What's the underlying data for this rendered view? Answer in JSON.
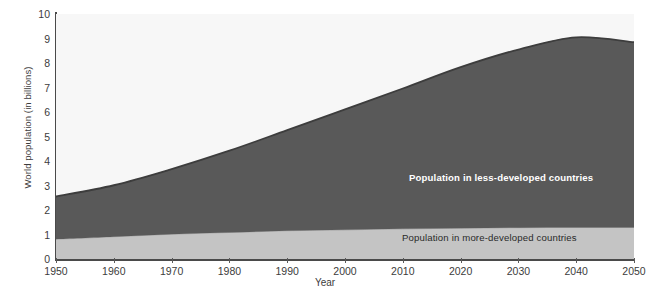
{
  "chart_data": {
    "type": "area",
    "title": "",
    "subtitle": "",
    "xlabel": "Year",
    "ylabel": "World population (in billions)",
    "xlim": [
      1950,
      2050
    ],
    "ylim": [
      0,
      10
    ],
    "grid": false,
    "legend_position": "in-plot annotations",
    "xticks": [
      1950,
      1960,
      1970,
      1980,
      1990,
      2000,
      2010,
      2020,
      2030,
      2040,
      2050
    ],
    "xtick_labels": [
      "1950",
      "1960",
      "1970",
      "1980",
      "1990",
      "2000",
      "2010",
      "2020",
      "2030",
      "2040",
      "2050"
    ],
    "yticks": [
      0,
      1,
      2,
      3,
      4,
      5,
      6,
      7,
      8,
      9,
      10
    ],
    "ytick_labels": [
      "0",
      "1",
      "2",
      "3",
      "4",
      "5",
      "6",
      "7",
      "8",
      "9",
      "10"
    ],
    "stacked": true,
    "x": [
      1950,
      1960,
      1970,
      1980,
      1990,
      2000,
      2010,
      2020,
      2030,
      2040,
      2050
    ],
    "series": [
      {
        "name": "Population in more-developed countries",
        "color": "#c4c4c4",
        "label_color": "#2a2a2a",
        "values": [
          0.81,
          0.91,
          1.01,
          1.08,
          1.15,
          1.19,
          1.23,
          1.26,
          1.28,
          1.29,
          1.29
        ]
      },
      {
        "name": "Population in less-developed countries",
        "color": "#595959",
        "label_color": "#ffffff",
        "values": [
          1.74,
          2.1,
          2.66,
          3.34,
          4.11,
          4.92,
          5.73,
          6.57,
          7.27,
          7.76,
          7.56
        ]
      }
    ],
    "cumulative_totals": [
      2.55,
      3.01,
      3.67,
      4.42,
      5.26,
      6.11,
      6.96,
      7.83,
      8.55,
      9.05,
      8.85
    ],
    "annotations": [
      {
        "text": "Population in less-developed countries",
        "x": 2016,
        "y": 3.6
      },
      {
        "text": "Population in more-developed countries",
        "x": 2015,
        "y": 0.62
      }
    ],
    "colors": {
      "series_less_developed": "#595959",
      "series_more_developed": "#c4c4c4",
      "plot_background": "#f7f7f7",
      "axis": "#4a4a4a",
      "text": "#3c3c3c",
      "page_background": "#ffffff"
    }
  },
  "axes": {
    "y_title": "World population (in billions)",
    "x_title": "Year"
  },
  "caption": {
    "text": ""
  }
}
